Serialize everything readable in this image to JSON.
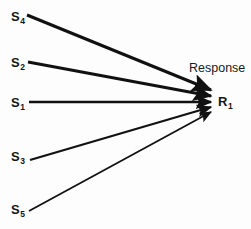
{
  "diagram": {
    "background_color": "#fdfdfd",
    "stroke_color": "#111111",
    "caption": {
      "response_label": "Response"
    },
    "response_node": {
      "id": "R1",
      "symbol": "R",
      "subscript": "1"
    },
    "stimulus_nodes": [
      {
        "id": "S4",
        "symbol": "S",
        "subscript": "4"
      },
      {
        "id": "S2",
        "symbol": "S",
        "subscript": "2"
      },
      {
        "id": "S1",
        "symbol": "S",
        "subscript": "1"
      },
      {
        "id": "S3",
        "symbol": "S",
        "subscript": "3"
      },
      {
        "id": "S5",
        "symbol": "S",
        "subscript": "5"
      }
    ],
    "arrows": [
      {
        "from": "S4",
        "to": "R1",
        "x1": 27,
        "y1": 15,
        "x2": 211,
        "y2": 90,
        "width": 3.0
      },
      {
        "from": "S2",
        "to": "R1",
        "x1": 28,
        "y1": 62,
        "x2": 211,
        "y2": 96,
        "width": 2.8
      },
      {
        "from": "S1",
        "to": "R1",
        "x1": 29,
        "y1": 102,
        "x2": 211,
        "y2": 102,
        "width": 2.4
      },
      {
        "from": "S3",
        "to": "R1",
        "x1": 30,
        "y1": 160,
        "x2": 211,
        "y2": 107,
        "width": 2.2
      },
      {
        "from": "S5",
        "to": "R1",
        "x1": 29,
        "y1": 211,
        "x2": 211,
        "y2": 112,
        "width": 1.8
      }
    ]
  }
}
